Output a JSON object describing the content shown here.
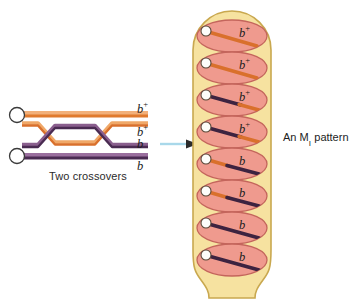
{
  "figure": {
    "left_panel": {
      "caption": "Two crossovers",
      "centromere_count": 2,
      "chromatid_labels": [
        {
          "text": "b",
          "superscript": "+",
          "y": 110
        },
        {
          "text": "b",
          "superscript": "+",
          "y": 133
        },
        {
          "text": "b",
          "superscript": "",
          "y": 145
        },
        {
          "text": "b",
          "superscript": "",
          "y": 167
        }
      ],
      "crossover_count": 2,
      "colors": {
        "chromatid_orange": "#e8833a",
        "chromatid_orange_light": "#f0a868",
        "chromatid_purple": "#4a2b52",
        "chromatid_purple_light": "#8a5f8e",
        "centromere_fill": "#ffffff",
        "centromere_stroke": "#3a3a3a"
      }
    },
    "arrow": {
      "direction": "right",
      "color": "#9fd4e8"
    },
    "ascus": {
      "caption": "An M",
      "caption_subscript": "I",
      "caption_suffix": " pattern",
      "spore_count": 8,
      "colors": {
        "ascus_fill": "#f5e09a",
        "ascus_stroke": "#c9a84f",
        "spore_fill": "#ef9a8e",
        "spore_stroke": "#c4655c",
        "nucleus_fill": "#fdfdfa",
        "nucleus_stroke": "#5a4a3a",
        "orange": "#d9702c",
        "purple": "#3d2340"
      },
      "spores": [
        {
          "index": 1,
          "label": "b",
          "superscript": "+",
          "chromosome": "orange"
        },
        {
          "index": 2,
          "label": "b",
          "superscript": "+",
          "chromosome": "orange"
        },
        {
          "index": 3,
          "label": "b",
          "superscript": "+",
          "chromosome": "purple-orange"
        },
        {
          "index": 4,
          "label": "b",
          "superscript": "+",
          "chromosome": "purple-orange"
        },
        {
          "index": 5,
          "label": "b",
          "superscript": "",
          "chromosome": "orange-purple"
        },
        {
          "index": 6,
          "label": "b",
          "superscript": "",
          "chromosome": "orange-purple"
        },
        {
          "index": 7,
          "label": "b",
          "superscript": "",
          "chromosome": "purple"
        },
        {
          "index": 8,
          "label": "b",
          "superscript": "",
          "chromosome": "purple"
        }
      ]
    }
  }
}
